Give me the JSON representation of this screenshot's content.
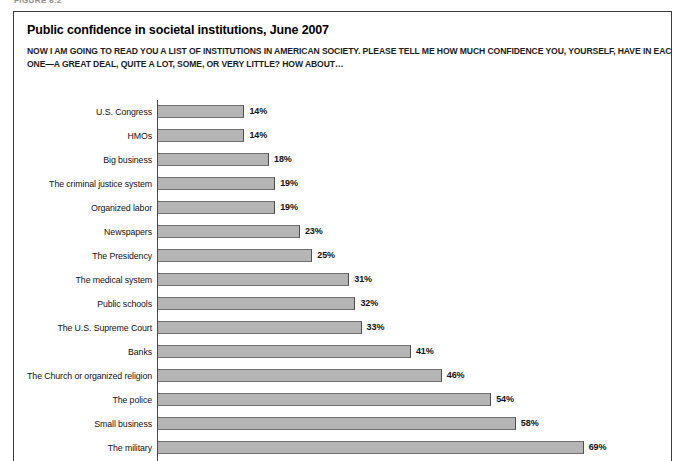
{
  "figure": {
    "tag": "FIGURE 6.2"
  },
  "panel": {
    "title": "Public confidence in societal institutions, June 2007",
    "subtitle_line1": "NOW I AM GOING TO READ YOU A LIST OF INSTITUTIONS IN AMERICAN SOCIETY. PLEASE TELL ME HOW MUCH CONFIDENCE YOU, YOURSELF, HAVE IN EACH",
    "subtitle_line2": "ONE—A GREAT DEAL, QUITE A LOT, SOME, OR VERY LITTLE? HOW ABOUT…"
  },
  "chart_data": {
    "type": "bar",
    "orientation": "horizontal",
    "title": "Public confidence in societal institutions, June 2007",
    "subtitle": "NOW I AM GOING TO READ YOU A LIST OF INSTITUTIONS IN AMERICAN SOCIETY. PLEASE TELL ME HOW MUCH CONFIDENCE YOU, YOURSELF, HAVE IN EACH ONE—A GREAT DEAL, QUITE A LOT, SOME, OR VERY LITTLE? HOW ABOUT…",
    "xlabel": "",
    "ylabel": "",
    "xlim": [
      0,
      80
    ],
    "grid": false,
    "legend": "none",
    "value_suffix": "%",
    "bar_color": "#b5b5b5",
    "bar_edge_color": "#4d4d4d",
    "axis_color": "#4a4a4a",
    "categories": [
      "U.S. Congress",
      "HMOs",
      "Big business",
      "The criminal justice system",
      "Organized labor",
      "Newspapers",
      "The Presidency",
      "The medical system",
      "Public schools",
      "The U.S. Supreme Court",
      "Banks",
      "The Church or organized religion",
      "The police",
      "Small business",
      "The military"
    ],
    "values": [
      14,
      14,
      18,
      19,
      19,
      23,
      25,
      31,
      32,
      33,
      41,
      46,
      54,
      58,
      69
    ],
    "labels": [
      "14%",
      "14%",
      "18%",
      "19%",
      "19%",
      "23%",
      "25%",
      "31%",
      "32%",
      "33%",
      "41%",
      "46%",
      "54%",
      "58%",
      "69%"
    ],
    "rows": [
      {
        "label": "U.S. Congress",
        "value": 14,
        "display": "14%"
      },
      {
        "label": "HMOs",
        "value": 14,
        "display": "14%"
      },
      {
        "label": "Big business",
        "value": 18,
        "display": "18%"
      },
      {
        "label": "The criminal justice system",
        "value": 19,
        "display": "19%"
      },
      {
        "label": "Organized labor",
        "value": 19,
        "display": "19%"
      },
      {
        "label": "Newspapers",
        "value": 23,
        "display": "23%"
      },
      {
        "label": "The Presidency",
        "value": 25,
        "display": "25%"
      },
      {
        "label": "The medical system",
        "value": 31,
        "display": "31%"
      },
      {
        "label": "Public schools",
        "value": 32,
        "display": "32%"
      },
      {
        "label": "The U.S. Supreme Court",
        "value": 33,
        "display": "33%"
      },
      {
        "label": "Banks",
        "value": 41,
        "display": "41%"
      },
      {
        "label": "The Church or organized religion",
        "value": 46,
        "display": "46%"
      },
      {
        "label": "The police",
        "value": 54,
        "display": "54%"
      },
      {
        "label": "Small business",
        "value": 58,
        "display": "58%"
      },
      {
        "label": "The military",
        "value": 69,
        "display": "69%"
      }
    ]
  }
}
